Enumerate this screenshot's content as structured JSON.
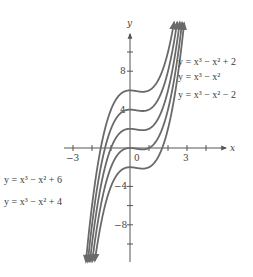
{
  "chart_data": {
    "type": "line",
    "title": "",
    "xlabel": "x",
    "ylabel": "y",
    "xlim": [
      -3.5,
      5
    ],
    "ylim": [
      -12,
      12
    ],
    "grid": false,
    "x_ticks": [
      -3,
      -2,
      -1,
      0,
      1,
      2,
      3,
      4
    ],
    "x_tick_labels": [
      {
        "value": -3,
        "label": "-3"
      },
      {
        "value": 0,
        "label": "0"
      },
      {
        "value": 3,
        "label": "3"
      }
    ],
    "y_ticks": [
      -10,
      -8,
      -6,
      -4,
      4,
      8,
      10
    ],
    "y_tick_labels": [
      {
        "value": 8,
        "label": "8"
      },
      {
        "value": 4,
        "label": "4"
      },
      {
        "value": -4,
        "label": "-4"
      },
      {
        "value": -8,
        "label": "-8"
      }
    ],
    "series": [
      {
        "name": "y = x^3 - x^2 + 6",
        "constant": 6
      },
      {
        "name": "y = x^3 - x^2 + 4",
        "constant": 4
      },
      {
        "name": "y = x^3 - x^2 + 2",
        "constant": 2
      },
      {
        "name": "y = x^3 - x^2",
        "constant": 0
      },
      {
        "name": "y = x^3 - x^2 - 2",
        "constant": -2
      }
    ],
    "legend": {
      "right": [
        {
          "text": "y = x³ − x² + 2",
          "x": 178,
          "y": 65
        },
        {
          "text": "y = x³ − x²",
          "x": 178,
          "y": 80
        },
        {
          "text": "y = x³ − x² − 2",
          "x": 178,
          "y": 98
        }
      ],
      "left": [
        {
          "text": "y = x³ − x² + 6",
          "x": 4,
          "y": 183
        },
        {
          "text": "y = x³ − x² + 4",
          "x": 4,
          "y": 205
        }
      ]
    }
  },
  "axes": {
    "x_label": "x",
    "y_label": "y",
    "origin_label": "0"
  }
}
